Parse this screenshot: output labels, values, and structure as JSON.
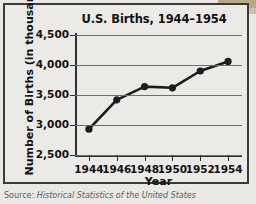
{
  "chart_data": {
    "type": "line",
    "title": "U.S. Births, 1944–1954",
    "xlabel": "Year",
    "ylabel": "Number of Births (in thousands)",
    "x": [
      1944,
      1946,
      1948,
      1950,
      1952,
      1954
    ],
    "values": [
      2930,
      3420,
      3640,
      3620,
      3900,
      4060
    ],
    "xtick_labels": [
      "1944",
      "1946",
      "1948",
      "1950",
      "1952",
      "1954"
    ],
    "ytick_labels": [
      "2,500",
      "3,000",
      "3,500",
      "4,000",
      "4,500"
    ],
    "ytick_values": [
      2500,
      3000,
      3500,
      4000,
      4500
    ],
    "xlim": [
      1943,
      1955
    ],
    "ylim": [
      2500,
      4500
    ],
    "grid": "horizontal",
    "legend": "none",
    "marker": "filled-circle",
    "series_color": "#1c1c1c",
    "grid_color": "#6d6d6d",
    "background_color": "#eceae6"
  },
  "source": {
    "prefix": "Source: ",
    "text": "Historical Statistics of the United States"
  }
}
